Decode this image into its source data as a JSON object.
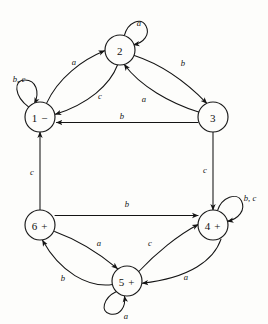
{
  "diagram": {
    "type": "finite-state-machine",
    "stroke_color": "#141414",
    "background_color": "#fdfdfb",
    "node_radius": 15,
    "nodes": [
      {
        "id": "1",
        "label": "1 −",
        "number": "1",
        "mark": "−",
        "cx": 40,
        "cy": 117
      },
      {
        "id": "2",
        "label": "2",
        "number": "2",
        "mark": "",
        "cx": 120,
        "cy": 50
      },
      {
        "id": "3",
        "label": "3",
        "number": "3",
        "mark": "",
        "cx": 213,
        "cy": 117
      },
      {
        "id": "4",
        "label": "4 +",
        "number": "4",
        "mark": "+",
        "cx": 213,
        "cy": 225
      },
      {
        "id": "5",
        "label": "5 +",
        "number": "5",
        "mark": "+",
        "cx": 127,
        "cy": 281
      },
      {
        "id": "6",
        "label": "6 +",
        "number": "6",
        "mark": "+",
        "cx": 40,
        "cy": 225
      }
    ],
    "edges": [
      {
        "from": "1",
        "to": "2",
        "label": "a",
        "label_x": 74,
        "label_y": 62
      },
      {
        "from": "2",
        "to": "1",
        "label": "c",
        "label_x": 100,
        "label_y": 96
      },
      {
        "from": "2",
        "to": "3",
        "label": "b",
        "label_x": 183,
        "label_y": 63
      },
      {
        "from": "3",
        "to": "2",
        "label": "a",
        "label_x": 144,
        "label_y": 99
      },
      {
        "from": "3",
        "to": "1",
        "label": "b",
        "label_x": 122,
        "label_y": 116
      },
      {
        "from": "3",
        "to": "4",
        "label": "c",
        "label_x": 205,
        "label_y": 170
      },
      {
        "from": "6",
        "to": "1",
        "label": "c",
        "label_x": 32,
        "label_y": 172
      },
      {
        "from": "6",
        "to": "4",
        "label": "b",
        "label_x": 127,
        "label_y": 204
      },
      {
        "from": "6",
        "to": "5",
        "label": "a",
        "label_x": 99,
        "label_y": 243
      },
      {
        "from": "5",
        "to": "6",
        "label": "b",
        "label_x": 63,
        "label_y": 278
      },
      {
        "from": "5",
        "to": "4",
        "label": "c",
        "label_x": 150,
        "label_y": 243
      },
      {
        "from": "4",
        "to": "5",
        "label": "a",
        "label_x": 186,
        "label_y": 277
      }
    ],
    "self_loops": [
      {
        "node": "1",
        "label": "b, c",
        "position": "upper-left",
        "label_x": 19,
        "label_y": 79
      },
      {
        "node": "2",
        "label": "a",
        "position": "top",
        "label_x": 139,
        "label_y": 23
      },
      {
        "node": "4",
        "label": "b, c",
        "position": "upper-right",
        "label_x": 250,
        "label_y": 198
      },
      {
        "node": "5",
        "label": "a",
        "position": "bottom-left",
        "label_x": 126,
        "label_y": 316
      }
    ]
  }
}
